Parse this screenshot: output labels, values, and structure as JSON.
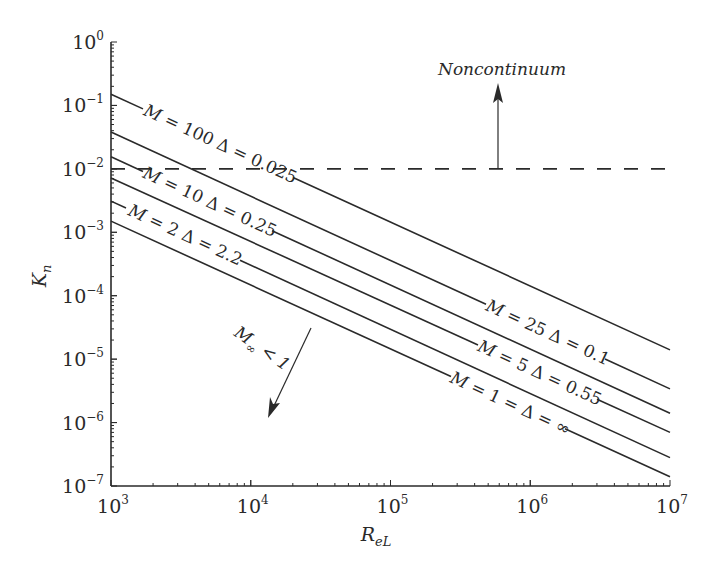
{
  "chart_data": {
    "type": "line",
    "title": "",
    "xlabel": "R_eL",
    "ylabel": "K_n",
    "xscale": "log",
    "yscale": "log",
    "xlim": [
      1000,
      10000000
    ],
    "ylim": [
      1e-07,
      1
    ],
    "grid": false,
    "x_ticks": [
      {
        "base": "10",
        "exp": "3",
        "value": 1000
      },
      {
        "base": "10",
        "exp": "4",
        "value": 10000
      },
      {
        "base": "10",
        "exp": "5",
        "value": 100000
      },
      {
        "base": "10",
        "exp": "6",
        "value": 1000000
      },
      {
        "base": "10",
        "exp": "7",
        "value": 10000000
      }
    ],
    "y_ticks": [
      {
        "base": "10",
        "exp": "0",
        "value": 1
      },
      {
        "base": "10",
        "exp": "−1",
        "value": 0.1
      },
      {
        "base": "10",
        "exp": "−2",
        "value": 0.01
      },
      {
        "base": "10",
        "exp": "−3",
        "value": 0.001
      },
      {
        "base": "10",
        "exp": "−4",
        "value": 0.0001
      },
      {
        "base": "10",
        "exp": "−5",
        "value": 1e-05
      },
      {
        "base": "10",
        "exp": "−6",
        "value": 1e-06
      },
      {
        "base": "10",
        "exp": "−7",
        "value": 1e-07
      }
    ],
    "x": [
      1000,
      10000000
    ],
    "series": [
      {
        "name": "M = 100 Δ = 0.025",
        "M": "100",
        "delta": "0.025",
        "values": [
          0.15,
          1.4e-05
        ],
        "label_x": [
          143,
          293
        ]
      },
      {
        "name": "M = 25 Δ = 0.1",
        "M": "25",
        "delta": "0.1",
        "values": [
          0.038,
          3.4e-06
        ],
        "label_x": [
          486,
          605
        ]
      },
      {
        "name": "M = 10 Δ = 0.25",
        "M": "10",
        "delta": "0.25",
        "values": [
          0.0155,
          1.4e-06
        ],
        "label_x": [
          143,
          272
        ]
      },
      {
        "name": "M = 5 Δ = 0.55",
        "M": "5",
        "delta": "0.55",
        "values": [
          0.0072,
          7e-07
        ],
        "label_x": [
          478,
          597
        ]
      },
      {
        "name": "M = 2 Δ = 2.2",
        "M": "2",
        "delta": "2.2",
        "values": [
          0.0031,
          2.8e-07
        ],
        "label_x": [
          126,
          240
        ]
      },
      {
        "name": "M = 1 = Δ = ∞",
        "M": "1 =",
        "delta": "∞",
        "values": [
          0.0015,
          1.4e-07
        ],
        "label_x": [
          451,
          565
        ]
      }
    ],
    "reference_lines": [
      {
        "type": "horizontal",
        "style": "dashed",
        "y": 0.01,
        "x_from": 1000,
        "x_to": 10000000
      }
    ],
    "annotations": [
      {
        "text": "Noncontinuum",
        "arrow": "up",
        "arrow_x": 35000000,
        "from_y": 0.01,
        "to_y": 0.22
      },
      {
        "text_main": "M",
        "text_sub": "∞",
        "text_rest": " < 1",
        "arrow": "down-left"
      }
    ]
  },
  "labels": {
    "xlabel_main": "R",
    "xlabel_sub": "eL",
    "ylabel_main": "K",
    "ylabel_sub": "n",
    "noncontinuum": "Noncontinuum",
    "subsonic_main": "M",
    "subsonic_sub": "∞",
    "subsonic_rest": " < 1"
  }
}
